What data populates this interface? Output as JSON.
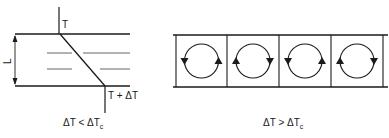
{
  "left_panel": {
    "top_temperature_label": "T",
    "bottom_temperature_label": "T + ΔT",
    "height_label": "L",
    "condition": {
      "prefix": "ΔT < ΔT",
      "subscript": "c"
    }
  },
  "right_panel": {
    "cell_count": 4,
    "cells": [
      {
        "rotation": "counterclockwise",
        "left_arrow": "down",
        "right_arrow": "up"
      },
      {
        "rotation": "clockwise",
        "left_arrow": "up",
        "right_arrow": "down"
      },
      {
        "rotation": "counterclockwise",
        "left_arrow": "down",
        "right_arrow": "up"
      },
      {
        "rotation": "clockwise",
        "left_arrow": "up",
        "right_arrow": "down"
      }
    ],
    "condition": {
      "prefix": "ΔT > ΔT",
      "subscript": "c"
    }
  },
  "colors": {
    "line": "#1a1a1a",
    "background": "#ffffff",
    "dash": "#555555"
  }
}
